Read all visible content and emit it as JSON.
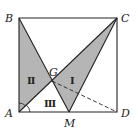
{
  "diagram": {
    "type": "geometry",
    "points": {
      "A": {
        "label": "A",
        "x": 19,
        "y": 112
      },
      "B": {
        "label": "B",
        "x": 19,
        "y": 18
      },
      "C": {
        "label": "C",
        "x": 117,
        "y": 18
      },
      "D": {
        "label": "D",
        "x": 117,
        "y": 112
      },
      "M": {
        "label": "M",
        "x": 69,
        "y": 112
      },
      "G": {
        "label": "G",
        "x": 52,
        "y": 81
      }
    },
    "regions": [
      {
        "label": "Ⅰ",
        "vertices": [
          "G",
          "M",
          "C"
        ],
        "shaded": true
      },
      {
        "label": "Ⅱ",
        "vertices": [
          "A",
          "B",
          "G"
        ],
        "shaded": true
      },
      {
        "label": "Ⅲ",
        "vertices": [
          "A",
          "G",
          "M"
        ],
        "shaded": false
      }
    ],
    "colors": {
      "shade": "#b5b5b5",
      "line": "#222222"
    }
  }
}
